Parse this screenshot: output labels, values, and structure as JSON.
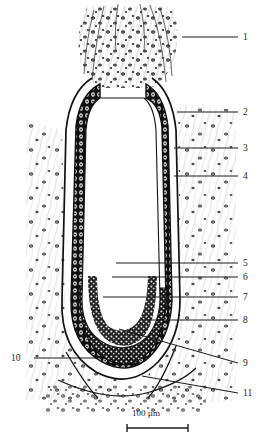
{
  "figure": {
    "kind": "histology-section-drawing",
    "title": "",
    "background_color": "#ffffff",
    "ink_color": "#1a1a1a"
  },
  "labels": [
    {
      "id": "1",
      "text": "1",
      "x": 243,
      "y": 33,
      "leader": {
        "x1": 182,
        "y1": 37,
        "x2": 238,
        "y2": 37
      }
    },
    {
      "id": "2",
      "text": "2",
      "x": 243,
      "y": 108,
      "leader": {
        "x1": 177,
        "y1": 112,
        "x2": 238,
        "y2": 112
      }
    },
    {
      "id": "3",
      "text": "3",
      "x": 243,
      "y": 144,
      "leader": {
        "x1": 174,
        "y1": 148,
        "x2": 238,
        "y2": 148
      }
    },
    {
      "id": "4",
      "text": "4",
      "x": 243,
      "y": 172,
      "leader": {
        "x1": 174,
        "y1": 176,
        "x2": 238,
        "y2": 176
      }
    },
    {
      "id": "5",
      "text": "5",
      "x": 243,
      "y": 259,
      "leader": {
        "x1": 116,
        "y1": 263,
        "x2": 238,
        "y2": 263
      }
    },
    {
      "id": "6",
      "text": "6",
      "x": 243,
      "y": 273,
      "leader": {
        "x1": 112,
        "y1": 277,
        "x2": 238,
        "y2": 277
      }
    },
    {
      "id": "7",
      "text": "7",
      "x": 243,
      "y": 293,
      "leader": {
        "x1": 103,
        "y1": 297,
        "x2": 238,
        "y2": 297
      }
    },
    {
      "id": "8",
      "text": "8",
      "x": 243,
      "y": 316,
      "leader": {
        "x1": 148,
        "y1": 320,
        "x2": 238,
        "y2": 320
      }
    },
    {
      "id": "9",
      "text": "9",
      "x": 243,
      "y": 359,
      "leader": {
        "x1": 119,
        "y1": 329,
        "x2": 238,
        "y2": 363
      }
    },
    {
      "id": "10",
      "text": "10",
      "x": 11,
      "y": 354,
      "leader": {
        "x1": 34,
        "y1": 358,
        "x2": 98,
        "y2": 358
      }
    },
    {
      "id": "11",
      "text": "11",
      "x": 243,
      "y": 389,
      "leader": {
        "x1": 142,
        "y1": 376,
        "x2": 238,
        "y2": 393
      }
    }
  ],
  "scale_bar": {
    "text": "100 µm",
    "text_x": 132,
    "text_y": 408,
    "x1": 127,
    "x2": 188,
    "y": 428,
    "cap_height": 8
  }
}
